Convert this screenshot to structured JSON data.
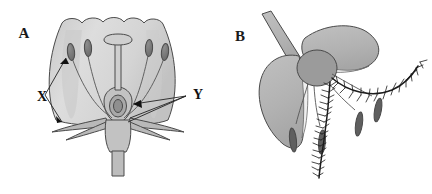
{
  "figure": {
    "width": 432,
    "height": 194,
    "background_color": "#ffffff",
    "panels": [
      {
        "id": "A",
        "letter": "A",
        "name": "insect-pollinated-flower",
        "title": "Insect-pollinated flower longitudinal section",
        "labels": [
          {
            "key": "X",
            "text": "X",
            "points_to": "anther",
            "x": 42,
            "y": 101
          },
          {
            "key": "Y",
            "text": "Y",
            "points_to": "ovary-with-ovule",
            "x": 193,
            "y": 99
          }
        ],
        "parts": [
          "corolla",
          "anther",
          "filament",
          "style",
          "stigma",
          "ovary",
          "ovule",
          "sepal",
          "receptacle",
          "pedicel"
        ],
        "anther_count": 4,
        "stamen_count": 4
      },
      {
        "id": "B",
        "letter": "B",
        "name": "wind-pollinated-flower",
        "title": "Wind-pollinated grass flower",
        "labels": [],
        "parts": [
          "glume",
          "lemma",
          "palea",
          "ovary",
          "feathery-stigma",
          "filament",
          "pendulous-anther",
          "stalk"
        ],
        "anther_count": 4,
        "feathery_stigma_count": 2
      }
    ]
  },
  "colors": {
    "background": "#ffffff",
    "corolla_fill": "#d6d6d6",
    "corolla_fill_light": "#e0e0e0",
    "corolla_shade": "#c4c4c4",
    "sepal_fill": "#b9b9b9",
    "anther_fill": "#7d7d7d",
    "anther_dark": "#6a6a6a",
    "ovary_fill": "#a8a8a8",
    "ovule_fill": "#9a9a9a",
    "glume_fill": "#b5b5b5",
    "glume_light": "#ededed",
    "center_ovary_fill": "#9b9b9b",
    "outline": "#4a4a4a",
    "leader_line": "#222222",
    "hair_stroke": "#1c1c1c",
    "label_text": "#111111"
  }
}
